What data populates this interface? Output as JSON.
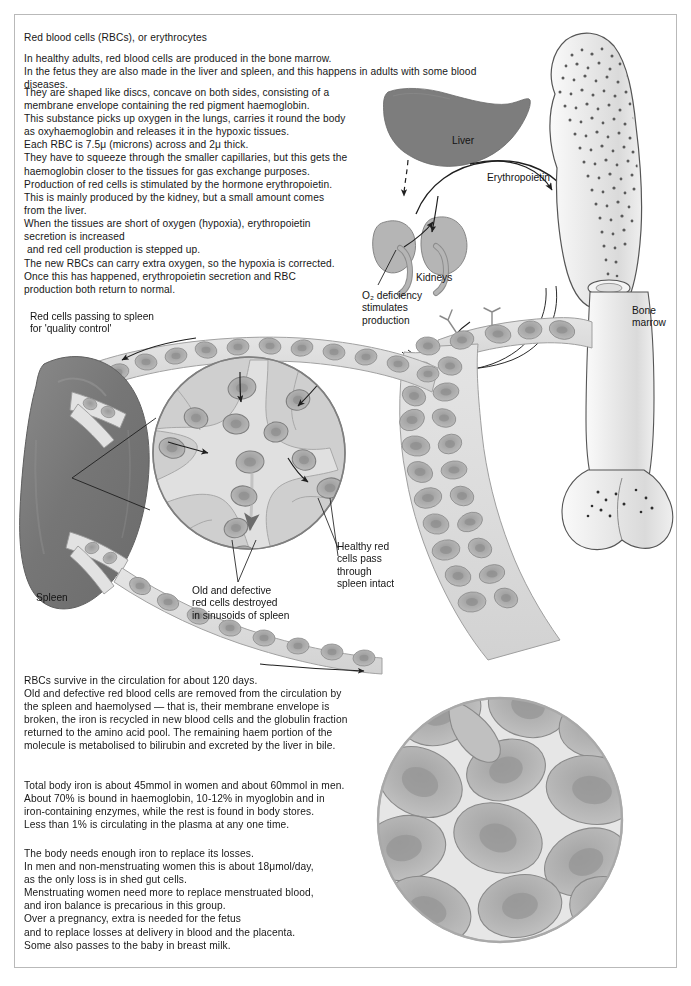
{
  "document": {
    "title": "Red blood cells (RBCs), or erythrocytes",
    "frame_color": "#b9b9b9"
  },
  "body_text": {
    "para1": "In healthy adults, red blood cells are produced in the bone marrow.\nIn the fetus they are also made in the liver and spleen, and this happens in adults with some blood diseases.",
    "para2": "They are shaped like discs, concave on both sides, consisting of a\nmembrane envelope containing the red pigment haemoglobin.\nThis substance picks up oxygen in the lungs, carries it round the body\nas oxyhaemoglobin and releases it in the hypoxic tissues.\nEach RBC is 7.5μ (microns) across and 2μ thick.\nThey have to squeeze through the smaller capillaries, but this gets the\nhaemoglobin closer to the tissues for gas exchange purposes.",
    "para3": "Production of red cells is stimulated by the hormone erythropoietin.\nThis is mainly produced by the kidney, but a small amount comes\nfrom the liver.\nWhen the tissues are short of oxygen (hypoxia), erythropoietin\nsecretion is increased\n and red cell production is stepped up.\nThe new RBCs can carry extra oxygen, so the hypoxia is corrected.\nOnce this has happened, erythropoietin secretion and RBC\nproduction both return to normal.",
    "para4": "RBCs survive in the circulation for about 120 days.\nOld and defective red blood cells are removed from the circulation by\nthe spleen and haemolysed — that is, their membrane envelope is\nbroken, the iron is recycled in new blood cells and the globulin fraction\nreturned to the amino acid pool. The remaining haem portion of the\nmolecule is metabolised to bilirubin and excreted by the liver in bile.",
    "para5": "Total body iron is about 45mmol in women and about 60mmol in men.\nAbout 70% is bound in haemoglobin, 10-12% in myoglobin and in\niron-containing enzymes, while the rest is found in body stores.\nLess than 1% is circulating in the plasma at any one time.",
    "para6": "The body needs enough iron to replace its losses.\nIn men and non-menstruating women this is about 18μmol/day,\nas the only loss is in shed gut cells.\nMenstruating women need more to replace menstruated blood,\nand iron balance is precarious in this group.\nOver a pregnancy, extra is needed for the fetus\nand to replace losses at delivery in blood and the placenta.\nSome also passes to the baby in breast milk."
  },
  "diagram": {
    "labels": {
      "liver": "Liver",
      "erythropoietin": "Erythropoietin",
      "kidneys": "Kidneys",
      "o2_deficiency": "O₂ deficiency\nstimulates\nproduction",
      "bone_marrow": "Bone\nmarrow",
      "red_cells_passing": "Red cells passing to spleen\nfor 'quality control'",
      "spleen": "Spleen",
      "old_defective": "Old and defective\nred cells destroyed\nin sinusoids of spleen",
      "healthy_cells": "Healthy red\ncells pass\nthrough\nspleen intact"
    },
    "colors": {
      "liver_fill": "#7d7d7d",
      "spleen_fill": "#767676",
      "kidney_fill": "#b5b5b5",
      "bone_outline": "#555555",
      "bone_fill": "#e8e8e8",
      "marrow_stipple": "#5a5a5a",
      "vessel_wall": "#d8d8d8",
      "rbc_fill": "#a9a9a9",
      "rbc_center": "#8f8f8f",
      "sinusoid_fill": "#b0b0b0",
      "arrow_stroke": "#1f1f1f"
    }
  }
}
